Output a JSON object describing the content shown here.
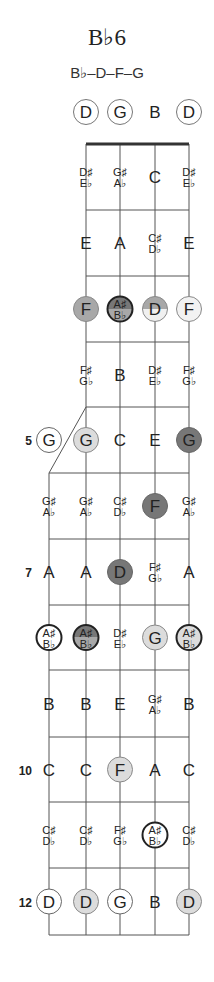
{
  "chord": {
    "name": "B♭6",
    "formula": "B♭–D–F–G"
  },
  "colors": {
    "line": "#555555",
    "nut": "#333333",
    "dark": "#777777",
    "medium": "#a8a8a8",
    "light": "#dcdcdc",
    "white": "#ffffff"
  },
  "open_strings": [
    {
      "string": 4,
      "label": "D",
      "circled": true
    },
    {
      "string": 3,
      "label": "G",
      "circled": true
    },
    {
      "string": 2,
      "label": "B",
      "circled": false
    },
    {
      "string": 1,
      "label": "D",
      "circled": true
    }
  ],
  "fret_markers": [
    {
      "fret": 5,
      "label": "5"
    },
    {
      "fret": 7,
      "label": "7"
    },
    {
      "fret": 10,
      "label": "10"
    },
    {
      "fret": 12,
      "label": "12"
    }
  ],
  "frets": [
    {
      "fret": 1,
      "notes": [
        null,
        {
          "t": "D♯",
          "b": "E♭"
        },
        {
          "t": "G♯",
          "b": "A♭"
        },
        {
          "n": "C"
        },
        {
          "t": "D♯",
          "b": "E♭"
        }
      ]
    },
    {
      "fret": 2,
      "notes": [
        null,
        {
          "n": "E"
        },
        {
          "n": "A"
        },
        {
          "t": "C♯",
          "b": "D♭"
        },
        {
          "n": "E"
        }
      ]
    },
    {
      "fret": 3,
      "notes": [
        null,
        {
          "n": "F",
          "fill": "medium"
        },
        {
          "t": "A♯",
          "b": "B♭",
          "fill": "split-root"
        },
        {
          "n": "D",
          "fill": "split"
        },
        {
          "n": "F",
          "fill": "lightwhite"
        }
      ]
    },
    {
      "fret": 4,
      "notes": [
        null,
        {
          "t": "F♯",
          "b": "G♭"
        },
        {
          "n": "B"
        },
        {
          "t": "D♯",
          "b": "E♭"
        },
        {
          "t": "F♯",
          "b": "G♭"
        }
      ]
    },
    {
      "fret": 5,
      "notes": [
        {
          "n": "G",
          "fill": "white"
        },
        {
          "n": "G",
          "fill": "light"
        },
        {
          "n": "C"
        },
        {
          "n": "E"
        },
        {
          "n": "G",
          "fill": "dark"
        }
      ]
    },
    {
      "fret": 6,
      "notes": [
        {
          "t": "G♯",
          "b": "A♭"
        },
        {
          "t": "G♯",
          "b": "A♭"
        },
        {
          "t": "C♯",
          "b": "D♭"
        },
        {
          "n": "F",
          "fill": "dark"
        },
        {
          "t": "G♯",
          "b": "A♭"
        }
      ]
    },
    {
      "fret": 7,
      "notes": [
        {
          "n": "A"
        },
        {
          "n": "A"
        },
        {
          "n": "D",
          "fill": "dark"
        },
        {
          "t": "F♯",
          "b": "G♭"
        },
        {
          "n": "A"
        }
      ]
    },
    {
      "fret": 8,
      "notes": [
        {
          "t": "A♯",
          "b": "B♭",
          "fill": "white-root"
        },
        {
          "t": "A♯",
          "b": "B♭",
          "fill": "split-root"
        },
        {
          "t": "D♯",
          "b": "E♭"
        },
        {
          "n": "G",
          "fill": "light"
        },
        {
          "t": "A♯",
          "b": "B♭",
          "fill": "light-root"
        }
      ]
    },
    {
      "fret": 9,
      "notes": [
        {
          "n": "B"
        },
        {
          "n": "B"
        },
        {
          "n": "E"
        },
        {
          "t": "G♯",
          "b": "A♭"
        },
        {
          "n": "B"
        }
      ]
    },
    {
      "fret": 10,
      "notes": [
        {
          "n": "C"
        },
        {
          "n": "C"
        },
        {
          "n": "F",
          "fill": "light"
        },
        {
          "n": "A"
        },
        {
          "n": "C"
        }
      ]
    },
    {
      "fret": 11,
      "notes": [
        {
          "t": "C♯",
          "b": "D♭"
        },
        {
          "t": "C♯",
          "b": "D♭"
        },
        {
          "t": "F♯",
          "b": "G♭"
        },
        {
          "t": "A♯",
          "b": "B♭",
          "fill": "white-root"
        },
        {
          "t": "C♯",
          "b": "D♭"
        }
      ]
    },
    {
      "fret": 12,
      "notes": [
        {
          "n": "D",
          "fill": "white"
        },
        {
          "n": "D",
          "fill": "light"
        },
        {
          "n": "G",
          "fill": "white"
        },
        {
          "n": "B"
        },
        {
          "n": "D",
          "fill": "light"
        }
      ]
    }
  ]
}
